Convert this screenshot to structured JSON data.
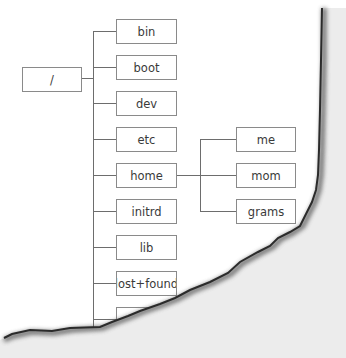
{
  "diagram": {
    "type": "directory-tree",
    "root": {
      "label": "/"
    },
    "root_children": [
      {
        "label": "bin"
      },
      {
        "label": "boot"
      },
      {
        "label": "dev"
      },
      {
        "label": "etc"
      },
      {
        "label": "home"
      },
      {
        "label": "initrd"
      },
      {
        "label": "lib"
      },
      {
        "label": "lost+found"
      },
      {
        "label": "m"
      }
    ],
    "home_children": [
      {
        "label": "me"
      },
      {
        "label": "mom"
      },
      {
        "label": "grams"
      }
    ],
    "colors": {
      "box_border": "#8a8a8a",
      "connector": "#6d6d6d",
      "text": "#3a3a3a",
      "torn_area": "#ececec",
      "torn_edge": "#2b2b2b"
    }
  }
}
